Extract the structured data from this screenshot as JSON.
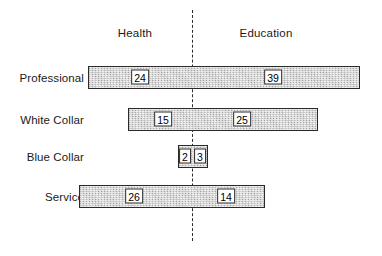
{
  "chart_data": {
    "type": "bar",
    "subtype": "diverging-stacked-bar",
    "title": "",
    "subtitle": "",
    "xlabel": "",
    "ylabel": "",
    "grid": false,
    "legend_position": "top",
    "axis_note": "Values diverge from a central dashed baseline; left segment = Health, right segment = Education.",
    "categories": [
      "Professional",
      "White Collar",
      "Blue Collar",
      "Service"
    ],
    "series": [
      {
        "name": "Health",
        "side": "left",
        "values": [
          24,
          15,
          2,
          26
        ]
      },
      {
        "name": "Education",
        "side": "right",
        "values": [
          39,
          25,
          3,
          14
        ]
      }
    ],
    "annotations": [
      {
        "category": "Professional",
        "series": "Health",
        "value": 24,
        "label": "24"
      },
      {
        "category": "Professional",
        "series": "Education",
        "value": 39,
        "label": "39"
      },
      {
        "category": "White Collar",
        "series": "Health",
        "value": 15,
        "label": "15"
      },
      {
        "category": "White Collar",
        "series": "Education",
        "value": 25,
        "label": "25"
      },
      {
        "category": "Blue Collar",
        "series": "Health",
        "value": 2,
        "label": "2"
      },
      {
        "category": "Blue Collar",
        "series": "Education",
        "value": 3,
        "label": "3"
      },
      {
        "category": "Service",
        "series": "Health",
        "value": 26,
        "label": "26"
      },
      {
        "category": "Service",
        "series": "Education",
        "value": 14,
        "label": "14"
      }
    ]
  },
  "headers": {
    "left": "Health",
    "right": "Education"
  },
  "rows": [
    {
      "label": "Professional",
      "left_value": "24",
      "right_value": "39"
    },
    {
      "label": "White Collar",
      "left_value": "15",
      "right_value": "25"
    },
    {
      "label": "Blue Collar",
      "left_value": "2",
      "right_value": "3"
    },
    {
      "label": "Service",
      "left_value": "26",
      "right_value": "14"
    }
  ],
  "colors": {
    "bar_fill": "#c9c9c9",
    "bar_border": "#2a2a2a",
    "divider": "#2b2b2b",
    "text": "#1a1a1a",
    "background": "#ffffff"
  },
  "geometry": {
    "center_x": 192,
    "divider_top": 10,
    "divider_bottom": 241,
    "label_right_edge": 84,
    "header_y": 27,
    "header_left_x": 135,
    "header_right_x": 266,
    "bar_height": 23,
    "rows": [
      {
        "top": 66,
        "left": 88,
        "right": 360
      },
      {
        "top": 108,
        "left": 128,
        "right": 318
      },
      {
        "top": 145,
        "left": 178,
        "right": 208
      },
      {
        "top": 185,
        "left": 79,
        "right": 265
      }
    ],
    "value_positions": [
      {
        "left_x": 140,
        "right_x": 273,
        "y": 77
      },
      {
        "left_x": 163,
        "right_x": 242,
        "y": 119
      },
      {
        "left_x": 185,
        "right_x": 200,
        "y": 156
      },
      {
        "left_x": 134,
        "right_x": 226,
        "y": 196
      }
    ]
  }
}
